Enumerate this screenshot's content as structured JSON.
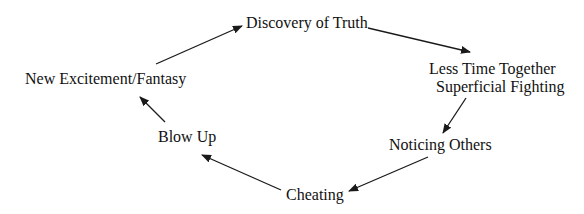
{
  "diagram": {
    "type": "cycle",
    "background": "#ffffff",
    "stroke_color": "#1a1a1a",
    "text_color": "#111111",
    "nodes": [
      {
        "id": "discovery",
        "lines": [
          "Discovery of Truth"
        ]
      },
      {
        "id": "less-time",
        "lines": [
          "Less Time Together",
          "Superficial Fighting"
        ]
      },
      {
        "id": "noticing",
        "lines": [
          "Noticing Others"
        ]
      },
      {
        "id": "cheating",
        "lines": [
          "Cheating"
        ]
      },
      {
        "id": "blow-up",
        "lines": [
          "Blow Up"
        ]
      },
      {
        "id": "new-excitement",
        "lines": [
          "New Excitement/Fantasy"
        ]
      }
    ],
    "edges": [
      {
        "from": "new-excitement",
        "to": "discovery"
      },
      {
        "from": "discovery",
        "to": "less-time"
      },
      {
        "from": "less-time",
        "to": "noticing"
      },
      {
        "from": "noticing",
        "to": "cheating"
      },
      {
        "from": "cheating",
        "to": "blow-up"
      },
      {
        "from": "blow-up",
        "to": "new-excitement"
      }
    ]
  }
}
